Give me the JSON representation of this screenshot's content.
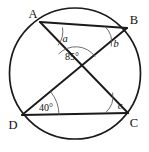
{
  "figure": {
    "kind": "circle-geometry-diagram",
    "background_color": "#ffffff",
    "stroke_color": "#1a1a1a",
    "arc_color": "#555555"
  },
  "circle": {
    "name": "circumscribed-circle",
    "center_x": 75,
    "center_y": 73.5,
    "radius": 65.5
  },
  "vertices": [
    {
      "id": "A",
      "label": "A",
      "x": 40,
      "y": 22,
      "label_x": 30,
      "label_y": 17
    },
    {
      "id": "B",
      "label": "B",
      "x": 127,
      "y": 28,
      "label_x": 131,
      "label_y": 23
    },
    {
      "id": "C",
      "label": "C",
      "x": 128,
      "y": 113,
      "label_x": 131,
      "label_y": 126
    },
    {
      "id": "D",
      "label": "D",
      "x": 22,
      "y": 115,
      "label_x": 10,
      "label_y": 128
    }
  ],
  "segments": [
    {
      "name": "chord-AB",
      "from": "A",
      "to": "B"
    },
    {
      "name": "chord-DC",
      "from": "D",
      "to": "C"
    },
    {
      "name": "diagonal-AC",
      "from": "A",
      "to": "C"
    },
    {
      "name": "diagonal-DB",
      "from": "D",
      "to": "B"
    }
  ],
  "intersection": {
    "name": "diagonal-intersection",
    "x": 77,
    "y": 70
  },
  "angles": [
    {
      "id": "a",
      "label": "a",
      "kind": "variable",
      "vertex": "A",
      "between": [
        "AB",
        "AC"
      ],
      "label_x": 57,
      "label_y": 40,
      "arc_d": "M 62.5 27.4 A 23 23 0 0 1 58.0 45.3"
    },
    {
      "id": "b",
      "label": "b",
      "kind": "variable",
      "vertex": "B",
      "between": [
        "BA",
        "BD"
      ],
      "label_x": 108,
      "label_y": 45,
      "arc_d": "M 105.0 26.5 A 22 22 0 0 1 111.2 46.4"
    },
    {
      "id": "apex",
      "label": "85°",
      "kind": "measure",
      "value": 85,
      "unit": "degrees",
      "vertex": "diagonal-intersection",
      "between": [
        "intersection-to-A",
        "intersection-to-B"
      ],
      "label_x": 64,
      "label_y": 58,
      "arc_d": "M 58.6 54.0 A 24 24 0 0 1 95.2 56.7"
    },
    {
      "id": "d40",
      "label": "40°",
      "kind": "measure",
      "value": 40,
      "unit": "degrees",
      "vertex": "D",
      "between": [
        "DC",
        "DB"
      ],
      "label_x": 38,
      "label_y": 109,
      "arc_d": "M 59.0 114.7 A 37 37 0 0 0 50.5 91.6"
    },
    {
      "id": "c",
      "label": "c",
      "kind": "variable",
      "vertex": "C",
      "between": [
        "CD",
        "CA"
      ],
      "label_x": 112,
      "label_y": 107,
      "arc_d": "M 106.0 112.3 A 22 22 0 0 0 112.6 92.6"
    }
  ]
}
